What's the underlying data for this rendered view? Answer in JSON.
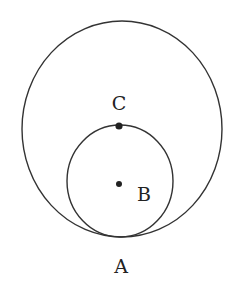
{
  "diagram": {
    "type": "geometry-tangent-circles",
    "stroke_color": "#333333",
    "background": "#ffffff",
    "large_circle": {
      "cx": 122,
      "cy": 129,
      "rx": 100,
      "ry": 108
    },
    "small_circle": {
      "cx": 120,
      "cy": 181,
      "rx": 53,
      "ry": 56
    },
    "points": [
      {
        "name": "C",
        "x": 119,
        "y": 126,
        "label": "C",
        "label_x": 119,
        "label_y": 110,
        "dot": true
      },
      {
        "name": "B",
        "x": 119,
        "y": 184,
        "label": "B",
        "label_x": 144,
        "label_y": 201,
        "dot": true
      },
      {
        "name": "A",
        "x": 121,
        "y": 237,
        "label": "A",
        "label_x": 121,
        "label_y": 273,
        "dot": false
      }
    ]
  }
}
